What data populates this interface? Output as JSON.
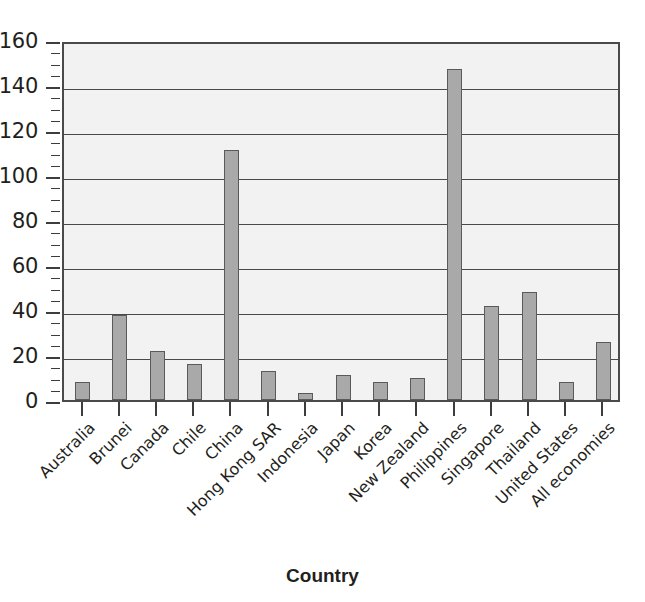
{
  "chart_data": {
    "type": "bar",
    "title": "",
    "subtitle": "",
    "xlabel": "Country",
    "ylabel": "",
    "ylim": [
      0,
      160
    ],
    "ytick_step": 20,
    "yminor_step": 5,
    "grid": true,
    "gridlines_at": [
      20,
      40,
      60,
      80,
      100,
      120,
      140
    ],
    "legend": null,
    "legend_position": "none",
    "bar_fill_color": "#a9a9a9",
    "bar_edge_color": "#5a5a5a",
    "plot_background_color": "#f2f2f2",
    "axis_color": "#4a4a4a",
    "text_color": "#231f20",
    "ytick_labels": [
      "160",
      "140",
      "120",
      "100",
      "80",
      "60",
      "40",
      "20",
      "0"
    ],
    "categories": [
      "Australia",
      "Brunei",
      "Canada",
      "Chile",
      "China",
      "Hong Kong SAR",
      "Indonesia",
      "Japan",
      "Korea",
      "New Zealand",
      "Philippines",
      "Singapore",
      "Thailand",
      "United States",
      "All economies"
    ],
    "values": [
      8,
      38,
      22,
      16,
      111,
      13,
      3,
      11,
      8,
      10,
      147,
      42,
      48,
      8,
      26
    ]
  }
}
